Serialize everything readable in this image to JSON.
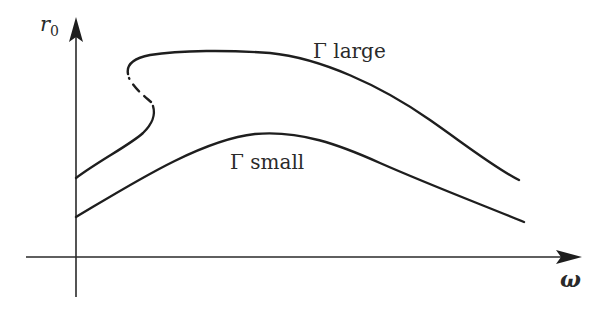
{
  "figure": {
    "y_axis_label": "r",
    "y_axis_label_sub": "0",
    "x_axis_label": "ω",
    "curves": [
      {
        "name": "Γ large",
        "label": "Γ large",
        "has_fold": true,
        "unstable_branch": "dashed",
        "description": "Bistable response curve bending back near small ω with a dashed unstable branch"
      },
      {
        "name": "Γ small",
        "label": "Γ small",
        "has_fold": false,
        "description": "Single-valued response curve with a broad maximum"
      }
    ],
    "colors": {
      "line": "#1e1e1e",
      "axis": "#2a2a2a",
      "background": "#ffffff"
    }
  }
}
